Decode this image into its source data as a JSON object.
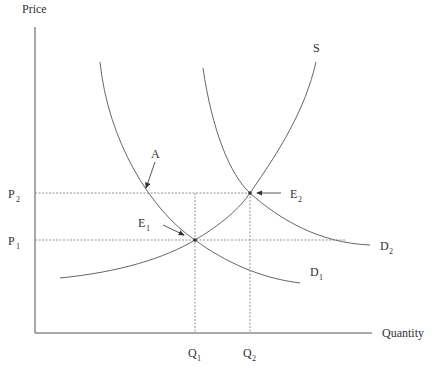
{
  "diagram": {
    "type": "supply-demand-shift",
    "axes": {
      "y_label": "Price",
      "x_label": "Quantity"
    },
    "price_levels": [
      {
        "id": "P2",
        "main": "P",
        "sub": "2"
      },
      {
        "id": "P1",
        "main": "P",
        "sub": "1"
      }
    ],
    "quantity_levels": [
      {
        "id": "Q1",
        "main": "Q",
        "sub": "1"
      },
      {
        "id": "Q2",
        "main": "Q",
        "sub": "2"
      }
    ],
    "curves": [
      {
        "id": "S",
        "label": "S",
        "sub": ""
      },
      {
        "id": "D1",
        "label": "D",
        "sub": "1"
      },
      {
        "id": "D2",
        "label": "D",
        "sub": "2"
      }
    ],
    "points": [
      {
        "id": "A",
        "label": "A",
        "sub": ""
      },
      {
        "id": "E1",
        "label": "E",
        "sub": "1"
      },
      {
        "id": "E2",
        "label": "E",
        "sub": "2"
      }
    ],
    "colors": {
      "axis": "#555555",
      "curve": "#666666",
      "guide": "#888888",
      "text": "#333333"
    }
  }
}
